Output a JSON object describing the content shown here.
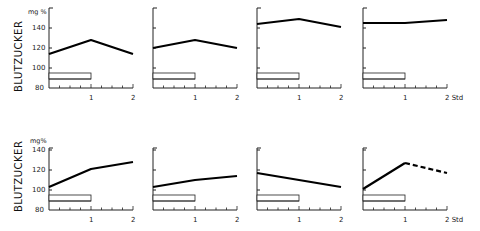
{
  "chart_data": {
    "type": "line",
    "layout": {
      "rows": 2,
      "cols": 4,
      "grid": false,
      "legend": "none"
    },
    "ylabel": "BLUTZUCKER",
    "yunit": "mg %",
    "xunit": "Std",
    "yticks": [
      80,
      100,
      120,
      140
    ],
    "ylim": [
      80,
      160
    ],
    "xticks": [
      1,
      2
    ],
    "xlim": [
      0,
      2
    ],
    "bar_annotation": {
      "description": "open rectangle from x=0 to x=1 near bottom of each panel",
      "x_start": 0,
      "x_end": 1
    },
    "panels": [
      {
        "row": 1,
        "col": 1,
        "x": [
          0,
          1,
          2
        ],
        "values": [
          114,
          128,
          114
        ],
        "style": "solid"
      },
      {
        "row": 1,
        "col": 2,
        "x": [
          0,
          1,
          2
        ],
        "values": [
          120,
          128,
          120
        ],
        "style": "solid"
      },
      {
        "row": 1,
        "col": 3,
        "x": [
          0,
          1,
          2
        ],
        "values": [
          144,
          149,
          141
        ],
        "style": "solid"
      },
      {
        "row": 1,
        "col": 4,
        "x": [
          0,
          1,
          2
        ],
        "values": [
          145,
          145,
          148
        ],
        "style": "solid"
      },
      {
        "row": 2,
        "col": 1,
        "x": [
          0,
          1,
          2
        ],
        "values": [
          103,
          121,
          128
        ],
        "style": "solid"
      },
      {
        "row": 2,
        "col": 2,
        "x": [
          0,
          1,
          2
        ],
        "values": [
          103,
          110,
          114
        ],
        "style": "solid"
      },
      {
        "row": 2,
        "col": 3,
        "x": [
          0,
          1,
          2
        ],
        "values": [
          117,
          110,
          103
        ],
        "style": "solid"
      },
      {
        "row": 2,
        "col": 4,
        "x": [
          0,
          1,
          2
        ],
        "values": [
          101,
          127,
          117
        ],
        "style": "solid-then-dashed"
      }
    ]
  },
  "labels": {
    "ylabel_top": "BLUTZUCKER",
    "ylabel_bottom": "BLUTZUCKER",
    "unit_top": "mg %",
    "unit_bottom": "mg%",
    "tick_140": "140",
    "tick_120": "120",
    "tick_100": "100",
    "tick_80": "80",
    "tick_160": "160",
    "x1": "1",
    "x2": "2",
    "std_top": "2 Std",
    "std_bottom": "2 Std"
  }
}
